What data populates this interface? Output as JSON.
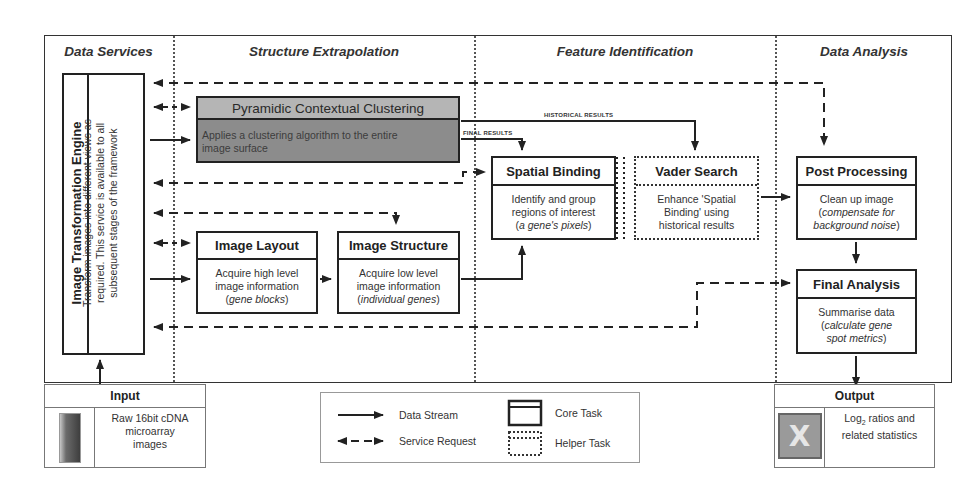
{
  "columns": [
    {
      "id": "data-services",
      "label": "Data Services"
    },
    {
      "id": "structure-extrapolation",
      "label": "Structure Extrapolation"
    },
    {
      "id": "feature-identification",
      "label": "Feature Identification"
    },
    {
      "id": "data-analysis",
      "label": "Data Analysis"
    }
  ],
  "engine": {
    "title": "Image Transformation Engine",
    "description_lines": [
      "Transform images into different views as",
      "required. This service is available to all",
      "subsequent stages of the framework"
    ]
  },
  "tasks": {
    "pyramidic": {
      "title": "Pyramidic Contextual Clustering",
      "description_lines": [
        "Applies a clustering algorithm to the entire",
        "image surface"
      ]
    },
    "image_layout": {
      "title": "Image Layout",
      "line1": "Acquire high level",
      "line2": "image information",
      "italic": "gene blocks"
    },
    "image_structure": {
      "title": "Image Structure",
      "line1": "Acquire low level",
      "line2": "image information",
      "italic": "individual genes"
    },
    "spatial_binding": {
      "title": "Spatial Binding",
      "line1": "Identify and group",
      "line2": "regions of interest",
      "italic": "a gene's pixels"
    },
    "vader_search": {
      "title": "Vader Search",
      "line1": "Enhance 'Spatial",
      "line2": "Binding' using",
      "line3": "historical results"
    },
    "post_processing": {
      "title": "Post Processing",
      "line1": "Clean up image",
      "italic1": "compensate for",
      "italic2": "background noise"
    },
    "final_analysis": {
      "title": "Final Analysis",
      "line1": "Summarise data",
      "italic1": "calculate gene",
      "italic2": "spot metrics"
    }
  },
  "edge_labels": {
    "historical_results": "HISTORICAL RESULTS",
    "final_results": "FINAL RESULTS"
  },
  "input": {
    "title": "Input",
    "icon": "microarray-image-icon",
    "lines": [
      "Raw 16bit cDNA",
      "microarray",
      "images"
    ]
  },
  "output": {
    "title": "Output",
    "icon": "spreadsheet-icon",
    "log_prefix": "Log",
    "log_sub": "2",
    "line1_rest": " ratios and",
    "line2": "related statistics"
  },
  "legend": {
    "items": [
      {
        "label": "Data Stream",
        "icon": "solid-arrow-icon"
      },
      {
        "label": "Service Request",
        "icon": "dashed-double-arrow-icon"
      },
      {
        "label": "Core Task",
        "icon": "solid-box-icon"
      },
      {
        "label": "Helper Task",
        "icon": "dotted-box-icon"
      }
    ]
  },
  "colors": {
    "line": "#222222",
    "grey_task_body": "#8c8c8c",
    "grey_task_header": "#b5b5b5",
    "divider": "#555555"
  }
}
